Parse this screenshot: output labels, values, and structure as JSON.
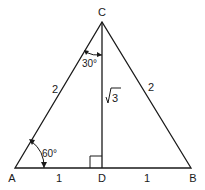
{
  "diagram": {
    "type": "triangle",
    "vertices": {
      "A": {
        "label": "A"
      },
      "B": {
        "label": "B"
      },
      "C": {
        "label": "C"
      },
      "D": {
        "label": "D"
      }
    },
    "side_labels": {
      "AC": "2",
      "BC": "2",
      "AD": "1",
      "DB": "1",
      "CD": "3"
    },
    "sqrt_symbol": "√",
    "angle_labels": {
      "A": "60°",
      "ACD": "30°"
    },
    "right_angle_at": "D",
    "stroke_color": "#1a1a1a",
    "background": "#ffffff"
  }
}
